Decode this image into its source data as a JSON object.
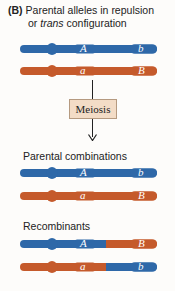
{
  "title": {
    "label": "(B)",
    "line1": "Parental alleles in repulsion",
    "line2_prefix": "or ",
    "line2_italic": "trans",
    "line2_suffix": " configuration"
  },
  "colors": {
    "blue": "#2e68a8",
    "orange": "#c55a2b",
    "meiosis_fill": "#f3dcc6"
  },
  "process": {
    "label": "Meiosis"
  },
  "sections": [
    {
      "name": "parental-input",
      "label": "",
      "chromosomes": [
        {
          "left_color": "blue",
          "right_color": "blue",
          "allele1": "A",
          "allele2": "b"
        },
        {
          "left_color": "orange",
          "right_color": "orange",
          "allele1": "a",
          "allele2": "B"
        }
      ]
    },
    {
      "name": "parental-combinations",
      "label": "Parental combinations",
      "chromosomes": [
        {
          "left_color": "blue",
          "right_color": "blue",
          "allele1": "A",
          "allele2": "b"
        },
        {
          "left_color": "orange",
          "right_color": "orange",
          "allele1": "a",
          "allele2": "B"
        }
      ]
    },
    {
      "name": "recombinants",
      "label": "Recombinants",
      "chromosomes": [
        {
          "left_color": "blue",
          "right_color": "orange",
          "allele1": "A",
          "allele2": "B"
        },
        {
          "left_color": "orange",
          "right_color": "blue",
          "allele1": "a",
          "allele2": "b"
        }
      ]
    }
  ]
}
